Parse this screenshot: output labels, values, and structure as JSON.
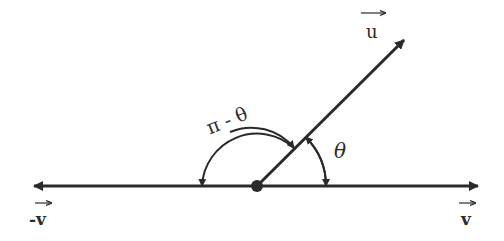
{
  "diagram": {
    "title": "",
    "vectors": {
      "u": {
        "label": "u",
        "arrow_mark": "→"
      },
      "v": {
        "label": "v",
        "arrow_mark": "→"
      },
      "neg_v": {
        "label": "-v",
        "arrow_mark": "→"
      }
    },
    "angles": {
      "theta": {
        "label": "θ"
      },
      "pi_minus_theta": {
        "label": "π - θ"
      }
    },
    "colors": {
      "stroke": "#2a2a2a",
      "background": "#ffffff"
    }
  }
}
